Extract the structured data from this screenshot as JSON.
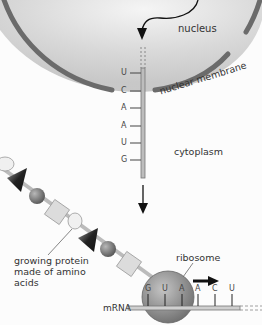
{
  "labels": {
    "nucleus": "nucleus",
    "nuclear_membrane": "nuclear membrane",
    "cytoplasm": "cytoplasm",
    "protein_line1": "growing protein",
    "protein_line2": "made of amino",
    "protein_line3": "acids",
    "ribosome": "ribosome",
    "mrna": "mRNA"
  },
  "strand_bases": [
    "U",
    "C",
    "A",
    "A",
    "U",
    "G"
  ],
  "ribosome_bases": [
    "G",
    "U",
    "A",
    "A",
    "C",
    "U"
  ],
  "colors": {
    "membrane": "#6b6b6b",
    "nucleus_fill": "#cfcfcf",
    "ribosome": "#8a8a8a",
    "amino_square": "#dcdcdc",
    "amino_sphere": "#7a7a7a",
    "amino_triangle": "#2a2a2a"
  }
}
